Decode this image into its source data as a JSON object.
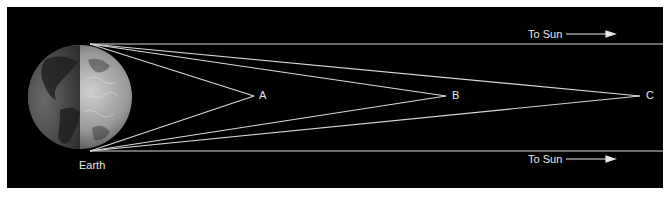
{
  "diagram": {
    "earth_label": "Earth",
    "points": [
      {
        "id": "A",
        "label": "A",
        "x": 256,
        "y": 96
      },
      {
        "id": "B",
        "label": "B",
        "x": 448,
        "y": 96
      },
      {
        "id": "C",
        "label": "C",
        "x": 642,
        "y": 96
      }
    ],
    "sun_labels": {
      "top": "To Sun",
      "bottom": "To Sun"
    },
    "colors": {
      "background": "#000000",
      "lines": "#d8d8d8",
      "text": "#e8e8e8",
      "border": "#ffffff"
    }
  }
}
